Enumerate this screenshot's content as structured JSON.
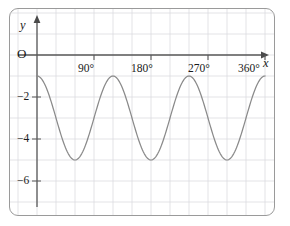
{
  "chart_data": {
    "type": "line",
    "title": "",
    "subtitle": "",
    "xlabel": "x",
    "ylabel": "y",
    "origin_label": "O",
    "xlim": [
      0,
      390
    ],
    "ylim": [
      -6.8,
      0.85
    ],
    "grid": true,
    "grid_x_step": 30,
    "grid_y_step": 1,
    "legend": "none",
    "x_tick_labels": [
      "90°",
      "180°",
      "270°",
      "360°"
    ],
    "x_tick_values": [
      90,
      180,
      270,
      360
    ],
    "y_tick_labels": [
      "−2",
      "−4",
      "−6"
    ],
    "y_tick_values": [
      -2,
      -4,
      -6
    ],
    "series": [
      {
        "name": "y = -3 + 2cos(3x)",
        "amplitude": 2,
        "midline": -3,
        "period": 120,
        "phase_deg": 0,
        "x_start": 0,
        "x_end": 360,
        "maxima_y": -1,
        "minima_y": -5,
        "maxima_x": [
          0,
          120,
          240,
          360
        ],
        "minima_x": [
          60,
          180,
          300
        ],
        "x": [
          0,
          10,
          20,
          30,
          40,
          50,
          60,
          70,
          80,
          90,
          100,
          110,
          120,
          130,
          140,
          150,
          160,
          170,
          180,
          190,
          200,
          210,
          220,
          230,
          240,
          250,
          260,
          270,
          280,
          290,
          300,
          310,
          320,
          330,
          340,
          350,
          360
        ],
        "values": [
          -1,
          -1.27,
          -2,
          -3,
          -4,
          -4.73,
          -5,
          -4.73,
          -4,
          -3,
          -2,
          -1.27,
          -1,
          -1.27,
          -2,
          -3,
          -4,
          -4.73,
          -5,
          -4.73,
          -4,
          -3,
          -2,
          -1.27,
          -1,
          -1.27,
          -2,
          -3,
          -4,
          -4.73,
          -5,
          -4.73,
          -4,
          -3,
          -2,
          -1.27,
          -1
        ]
      }
    ]
  },
  "labels": {
    "y_axis": "y",
    "x_axis": "x",
    "origin": "O",
    "x_tick_90": "90°",
    "x_tick_180": "180°",
    "x_tick_270": "270°",
    "x_tick_360": "360°",
    "y_tick_2": "−2",
    "y_tick_4": "−4",
    "y_tick_6": "−6"
  },
  "colors": {
    "frame": "#9a9a9a",
    "grid": "#d9d9dd",
    "axis": "#595959",
    "curve": "#8a8a8a",
    "text": "#1a1a1a",
    "background": "#ffffff"
  }
}
